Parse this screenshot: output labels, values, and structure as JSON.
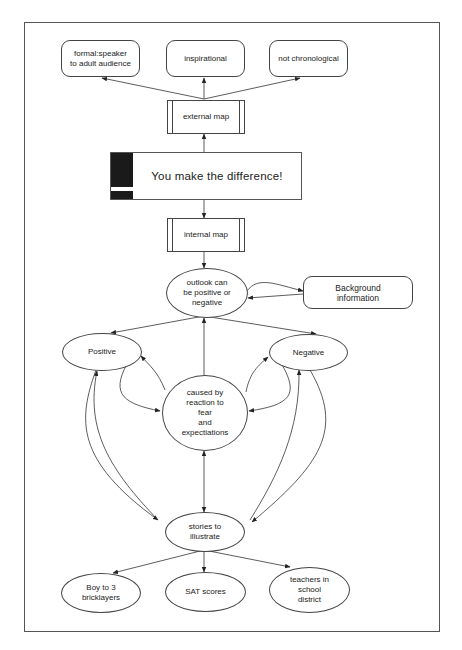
{
  "diagram": {
    "title": "You make the difference!",
    "nodes": {
      "formal": {
        "label": "formal:speaker\nto adult audience",
        "shape": "rounded-rect"
      },
      "inspirational": {
        "label": "inspirational",
        "shape": "rounded-rect"
      },
      "not_chronological": {
        "label": "not chronological",
        "shape": "rounded-rect"
      },
      "external_map": {
        "label": "external map",
        "shape": "process"
      },
      "main": {
        "label": "You make the difference!",
        "shape": "process-main"
      },
      "internal_map": {
        "label": "internal map",
        "shape": "process"
      },
      "outlook": {
        "label": "outlook can\nbe positive or\nnegative",
        "shape": "ellipse"
      },
      "background": {
        "label": "Background\ninformation",
        "shape": "rounded-rect"
      },
      "positive": {
        "label": "Positive",
        "shape": "ellipse"
      },
      "negative": {
        "label": "Negative",
        "shape": "ellipse"
      },
      "caused_by": {
        "label": "caused by\nreaction to\nfear\nand\nexpectiations",
        "shape": "circle"
      },
      "stories": {
        "label": "stories to\nillustrate",
        "shape": "ellipse"
      },
      "boy": {
        "label": "Boy to 3\nbricklayers",
        "shape": "ellipse"
      },
      "sat": {
        "label": "SAT scores",
        "shape": "ellipse"
      },
      "teachers": {
        "label": "teachers in\nschool\ndistrict",
        "shape": "ellipse"
      }
    },
    "edges": [
      {
        "from": "external_map",
        "to": "formal"
      },
      {
        "from": "external_map",
        "to": "inspirational"
      },
      {
        "from": "external_map",
        "to": "not_chronological"
      },
      {
        "from": "main",
        "to": "external_map"
      },
      {
        "from": "main",
        "to": "internal_map"
      },
      {
        "from": "internal_map",
        "to": "outlook"
      },
      {
        "from": "outlook",
        "to": "background"
      },
      {
        "from": "background",
        "to": "outlook"
      },
      {
        "from": "outlook",
        "to": "positive"
      },
      {
        "from": "outlook",
        "to": "negative"
      },
      {
        "from": "caused_by",
        "to": "outlook"
      },
      {
        "from": "positive",
        "to": "caused_by"
      },
      {
        "from": "caused_by",
        "to": "positive"
      },
      {
        "from": "negative",
        "to": "caused_by"
      },
      {
        "from": "caused_by",
        "to": "negative"
      },
      {
        "from": "caused_by",
        "to": "stories",
        "bidirectional": true
      },
      {
        "from": "positive",
        "to": "stories"
      },
      {
        "from": "stories",
        "to": "positive"
      },
      {
        "from": "negative",
        "to": "stories"
      },
      {
        "from": "stories",
        "to": "negative"
      },
      {
        "from": "stories",
        "to": "boy"
      },
      {
        "from": "stories",
        "to": "sat"
      },
      {
        "from": "stories",
        "to": "teachers"
      }
    ]
  }
}
